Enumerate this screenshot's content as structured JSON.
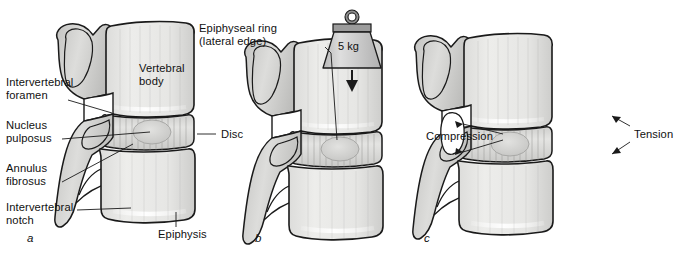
{
  "figure": {
    "type": "anatomical-illustration",
    "panels": [
      {
        "letter": "a",
        "name": "panel-a-anatomy",
        "labels": [
          {
            "id": "intervertebral-foramen",
            "text": "Intervertebral\nforamen"
          },
          {
            "id": "nucleus-pulposus",
            "text": "Nucleus\npulposus"
          },
          {
            "id": "annulus-fibrosus",
            "text": "Annulus\nfibrosus"
          },
          {
            "id": "intervertebral-notch",
            "text": "Intervertebral\nnotch"
          },
          {
            "id": "vertebral-body",
            "text": "Vertebral\nbody"
          },
          {
            "id": "epiphysis",
            "text": "Epiphysis"
          },
          {
            "id": "disc",
            "text": "Disc"
          }
        ]
      },
      {
        "letter": "b",
        "name": "panel-b-loaded",
        "labels": [
          {
            "id": "epiphyseal-ring",
            "text": "Epiphyseal ring\n(lateral edge)"
          },
          {
            "id": "weight-value",
            "text": "5 kg"
          }
        ]
      },
      {
        "letter": "c",
        "name": "panel-c-forces",
        "labels": [
          {
            "id": "compression",
            "text": "Compression"
          },
          {
            "id": "tension",
            "text": "Tension"
          }
        ]
      }
    ]
  },
  "text": {
    "intervertebral_foramen_l1": "Intervertebral",
    "intervertebral_foramen_l2": "foramen",
    "nucleus_pulposus_l1": "Nucleus",
    "nucleus_pulposus_l2": "pulposus",
    "annulus_fibrosus_l1": "Annulus",
    "annulus_fibrosus_l2": "fibrosus",
    "intervertebral_notch_l1": "Intervertebral",
    "intervertebral_notch_l2": "notch",
    "vertebral_body_l1": "Vertebral",
    "vertebral_body_l2": "body",
    "epiphysis": "Epiphysis",
    "disc": "Disc",
    "epiphyseal_ring_l1": "Epiphyseal ring",
    "epiphyseal_ring_l2": "(lateral edge)",
    "weight": "5 kg",
    "compression": "Compression",
    "tension": "Tension",
    "letter_a": "a",
    "letter_b": "b",
    "letter_c": "c"
  },
  "colors": {
    "background": "#ffffff",
    "outline": "#1a1a1a",
    "bone_light": "#e8e8e6",
    "bone_mid": "#d2d2d0",
    "bone_dark": "#b9b9b7",
    "disc_fill": "#dcdcda",
    "nucleus": "#cfcfcd",
    "foramen_white": "#ffffff",
    "weight_body": "#cfcfcf",
    "weight_top": "#9a9a9a",
    "text": "#111111"
  }
}
